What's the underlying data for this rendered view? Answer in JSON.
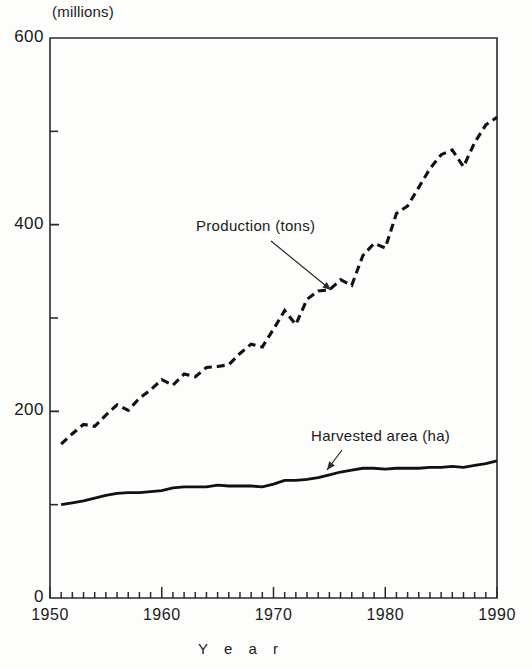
{
  "chart_data": {
    "type": "line",
    "title": "",
    "unit_label": "(millions)",
    "xlabel": "Y e a r",
    "ylabel": "",
    "xlim": [
      1950,
      1990
    ],
    "ylim": [
      0,
      600
    ],
    "grid": false,
    "legend_position": "inline-annotations",
    "y_major_ticks": [
      0,
      200,
      400,
      600
    ],
    "y_minor_ticks": [
      100,
      300,
      500
    ],
    "y_tick_labels": [
      "0",
      "200",
      "400",
      "600"
    ],
    "x_major_ticks": [
      1950,
      1960,
      1970,
      1980,
      1990
    ],
    "x_tick_labels": [
      "1950",
      "1960",
      "1970",
      "1980",
      "1990"
    ],
    "x_minor_tick_interval": 1,
    "x": [
      1951,
      1952,
      1953,
      1954,
      1955,
      1956,
      1957,
      1958,
      1959,
      1960,
      1961,
      1962,
      1963,
      1964,
      1965,
      1966,
      1967,
      1968,
      1969,
      1970,
      1971,
      1972,
      1973,
      1974,
      1975,
      1976,
      1977,
      1978,
      1979,
      1980,
      1981,
      1982,
      1983,
      1984,
      1985,
      1986,
      1987,
      1988,
      1989,
      1990
    ],
    "series": [
      {
        "name": "Production (tons)",
        "style": "dashed",
        "color": "#111111",
        "values": [
          165,
          176,
          186,
          184,
          196,
          207,
          201,
          214,
          223,
          234,
          228,
          240,
          237,
          247,
          248,
          250,
          262,
          272,
          269,
          288,
          308,
          293,
          320,
          329,
          330,
          341,
          335,
          367,
          380,
          375,
          412,
          420,
          440,
          460,
          475,
          480,
          462,
          488,
          507,
          515
        ]
      },
      {
        "name": "Harvested area (ha)",
        "style": "solid",
        "color": "#111111",
        "values": [
          100,
          102,
          104,
          107,
          110,
          112,
          113,
          113,
          114,
          115,
          118,
          119,
          119,
          119,
          121,
          120,
          120,
          120,
          119,
          122,
          126,
          126,
          127,
          129,
          132,
          135,
          137,
          139,
          139,
          138,
          139,
          139,
          139,
          140,
          140,
          141,
          140,
          142,
          144,
          147
        ]
      }
    ],
    "annotations": [
      {
        "text": "Production (tons)",
        "label_x": 196,
        "label_y": 217,
        "arrow_from_x": 271,
        "arrow_from_y": 241,
        "arrow_to_x": 331,
        "arrow_to_y": 290
      },
      {
        "text": "Harvested area (ha)",
        "label_x": 311,
        "label_y": 427,
        "arrow_from_x": 342,
        "arrow_from_y": 450,
        "arrow_to_x": 327,
        "arrow_to_y": 470
      }
    ]
  }
}
